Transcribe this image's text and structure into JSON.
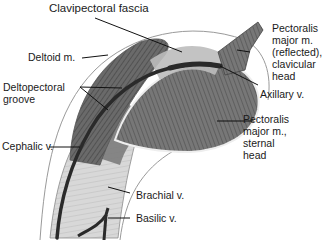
{
  "figure": {
    "labels": {
      "clavipectoral_fascia": "Clavipectoral fascia",
      "deltoid": "Deltoid m.",
      "deltopectoral_groove_1": "Deltopectoral",
      "deltopectoral_groove_2": "groove",
      "pec_clavicular_1": "Pectoralis",
      "pec_clavicular_2": "major m.",
      "pec_clavicular_3": "(reflected),",
      "pec_clavicular_4": "clavicular",
      "pec_clavicular_5": "head",
      "axillary_vein": "Axillary v.",
      "pec_sternal_1": "Pectoralis",
      "pec_sternal_2": "major m.,",
      "pec_sternal_3": "sternal",
      "pec_sternal_4": "head",
      "cephalic_vein": "Cephalic v.",
      "brachial_vein": "Brachial v.",
      "basilic_vein": "Basilic v."
    },
    "colors": {
      "muscle_dark": "#4a4a4a",
      "muscle_mid": "#7a7a7a",
      "muscle_light": "#b5b5b5",
      "tendon": "#dcdcdc",
      "vein": "#2a2a2a",
      "outline": "#8a8a8a",
      "leader": "#111111"
    }
  }
}
